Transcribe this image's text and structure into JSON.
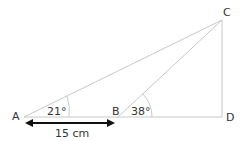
{
  "diagram": {
    "points": {
      "A": "A",
      "B": "B",
      "C": "C",
      "D": "D"
    },
    "angles": {
      "A": "21°",
      "B": "38°"
    },
    "length_AB": "15 cm",
    "line_color": "#c8c8c8",
    "arrow_color": "#111111"
  }
}
